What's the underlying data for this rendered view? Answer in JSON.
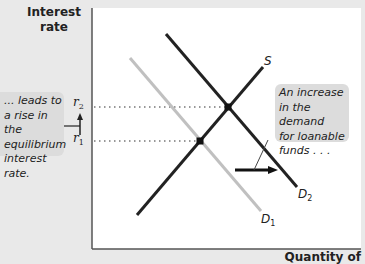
{
  "axes": {
    "y_title_line1": "Interest",
    "y_title_line2": "rate",
    "x_title": "Quantity of"
  },
  "rates": {
    "r2": {
      "symbol": "r",
      "sub": "2"
    },
    "r1": {
      "symbol": "r",
      "sub": "1"
    }
  },
  "curves": {
    "S": {
      "label": "S",
      "color": "#222222"
    },
    "D1": {
      "label": "D",
      "sub": "1",
      "color": "#c0c0c0"
    },
    "D2": {
      "label": "D",
      "sub": "2",
      "color": "#222222"
    }
  },
  "callouts": {
    "left": {
      "lines": [
        "... leads to",
        "a rise in the",
        "equilibrium",
        "interest rate."
      ]
    },
    "right": {
      "lines": [
        "An increase",
        "in the demand",
        "for loanable",
        "funds . . ."
      ]
    }
  },
  "equilibria": [
    {
      "name": "E1",
      "rate": "r1",
      "x": 200,
      "y": 141
    },
    {
      "name": "E2",
      "rate": "r2",
      "x": 228,
      "y": 107
    }
  ],
  "colors": {
    "background": "#e9e9e9",
    "plot": "#ffffff",
    "callout": "#dcdcdc",
    "ink": "#222222",
    "old_demand": "#c0c0c0"
  }
}
